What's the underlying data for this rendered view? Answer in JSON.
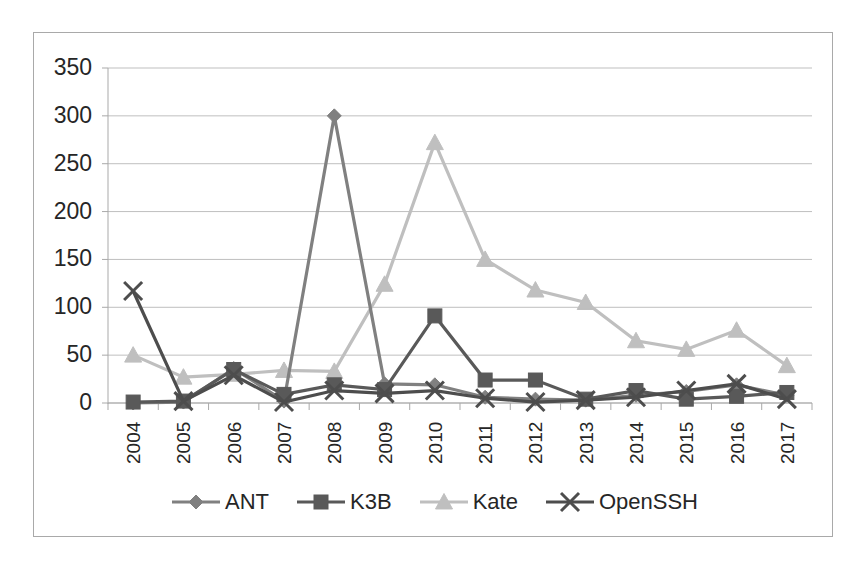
{
  "chart_data": {
    "type": "line",
    "title": "",
    "subtitle": "",
    "xlabel": "",
    "ylabel": "",
    "categories": [
      "2004",
      "2005",
      "2006",
      "2007",
      "2008",
      "2009",
      "2010",
      "2011",
      "2012",
      "2013",
      "2014",
      "2015",
      "2016",
      "2017"
    ],
    "ylim": [
      0,
      350
    ],
    "yticks": [
      0,
      50,
      100,
      150,
      200,
      250,
      300,
      350
    ],
    "ytick_labels": [
      "0",
      "50",
      "100",
      "150",
      "200",
      "250",
      "300",
      "350"
    ],
    "grid": true,
    "grid_axis": "y",
    "legend_position": "bottom",
    "markers": true,
    "series": [
      {
        "name": "ANT",
        "marker": "diamond",
        "color": "#808080",
        "values": [
          0,
          1,
          36,
          2,
          300,
          20,
          19,
          6,
          4,
          3,
          8,
          12,
          19,
          8
        ]
      },
      {
        "name": "K3B",
        "marker": "square",
        "color": "#595959",
        "values": [
          1,
          2,
          35,
          9,
          19,
          14,
          91,
          24,
          24,
          4,
          13,
          4,
          7,
          11
        ]
      },
      {
        "name": "Kate",
        "marker": "triangle",
        "color": "#bfbfbf",
        "values": [
          50,
          27,
          30,
          34,
          33,
          124,
          272,
          150,
          118,
          105,
          65,
          56,
          76,
          39
        ]
      },
      {
        "name": "OpenSSH",
        "marker": "x",
        "color": "#4d4d4d",
        "values": [
          117,
          2,
          29,
          1,
          13,
          10,
          13,
          5,
          1,
          3,
          6,
          13,
          20,
          4
        ]
      }
    ]
  },
  "legend": {
    "items": [
      {
        "label": "ANT"
      },
      {
        "label": "K3B"
      },
      {
        "label": "Kate"
      },
      {
        "label": "OpenSSH"
      }
    ]
  },
  "colors": {
    "background": "#ffffff",
    "frame": "#a9a9a9",
    "gridline": "#bfbfbf",
    "axis": "#a9a9a9",
    "text": "#262626"
  }
}
